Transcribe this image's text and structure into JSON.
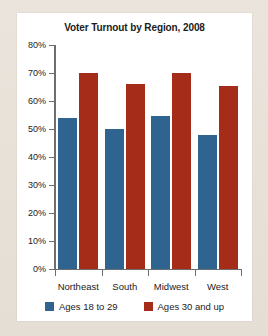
{
  "card": {
    "background": "#ffffff",
    "page_background": "#e6e0d7"
  },
  "chart_data": {
    "type": "bar",
    "title": "Voter Turnout by Region, 2008",
    "xlabel": "",
    "ylabel": "",
    "ylim": [
      0,
      80
    ],
    "ytick_labels": [
      "0%",
      "10%",
      "20%",
      "30%",
      "40%",
      "50%",
      "60%",
      "70%",
      "80%"
    ],
    "ytick_values": [
      0,
      10,
      20,
      30,
      40,
      50,
      60,
      70,
      80
    ],
    "grid": false,
    "legend_position": "bottom",
    "categories": [
      "Northeast",
      "South",
      "Midwest",
      "West"
    ],
    "series": [
      {
        "name": "Ages 18 to 29",
        "color": "#2f6490",
        "values": [
          54,
          50,
          54.5,
          48
        ]
      },
      {
        "name": "Ages 30 and up",
        "color": "#a42c19",
        "values": [
          70,
          66,
          70,
          65.5
        ]
      }
    ]
  }
}
